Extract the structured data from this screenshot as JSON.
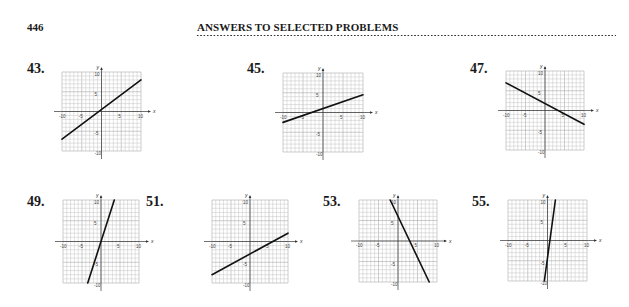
{
  "header": {
    "page_number": "446",
    "running_head": "ANSWERS TO SELECTED PROBLEMS"
  },
  "problems": [
    {
      "label": "43.",
      "pos": {
        "lx": 27,
        "ly": 61,
        "gx": 62,
        "gy": 72,
        "w": 79,
        "h": 79
      }
    },
    {
      "label": "45.",
      "pos": {
        "lx": 247,
        "ly": 61,
        "gx": 283,
        "gy": 73,
        "w": 80,
        "h": 79
      }
    },
    {
      "label": "47.",
      "pos": {
        "lx": 470,
        "ly": 61,
        "gx": 506,
        "gy": 71,
        "w": 78,
        "h": 79
      }
    },
    {
      "label": "49.",
      "pos": {
        "lx": 27,
        "ly": 194,
        "gx": 63,
        "gy": 200,
        "w": 76,
        "h": 83
      }
    },
    {
      "label": "51.",
      "pos": {
        "lx": 146,
        "ly": 194,
        "gx": 212,
        "gy": 200,
        "w": 76,
        "h": 83
      }
    },
    {
      "label": "53.",
      "pos": {
        "lx": 323,
        "ly": 194,
        "gx": 359,
        "gy": 200,
        "w": 78,
        "h": 82
      }
    },
    {
      "label": "55.",
      "pos": {
        "lx": 472,
        "ly": 194,
        "gx": 508,
        "gy": 200,
        "w": 79,
        "h": 81
      }
    }
  ],
  "chart_data": [
    {
      "type": "line",
      "title": "43.",
      "xlabel": "x",
      "ylabel": "y",
      "xlim": [
        -10,
        10
      ],
      "ylim": [
        -10,
        10
      ],
      "grid": true,
      "x_ticks": [
        "-10",
        "-5",
        "5",
        "10"
      ],
      "y_ticks": [
        "10",
        "5",
        "-5",
        "-10"
      ],
      "series": [
        {
          "name": "line",
          "x": [
            -10,
            10
          ],
          "y": [
            -7,
            8
          ]
        }
      ]
    },
    {
      "type": "line",
      "title": "45.",
      "xlabel": "x",
      "ylabel": "y",
      "xlim": [
        -10,
        10
      ],
      "ylim": [
        -10,
        10
      ],
      "grid": true,
      "x_ticks": [
        "-10",
        "-5",
        "5",
        "10"
      ],
      "y_ticks": [
        "10",
        "5",
        "-5",
        "-10"
      ],
      "series": [
        {
          "name": "line",
          "x": [
            -10,
            10
          ],
          "y": [
            -2.5,
            4.5
          ]
        }
      ]
    },
    {
      "type": "line",
      "title": "47.",
      "xlabel": "x",
      "ylabel": "y",
      "xlim": [
        -10,
        10
      ],
      "ylim": [
        -10,
        10
      ],
      "grid": true,
      "x_ticks": [
        "-10",
        "-5",
        "5",
        "10"
      ],
      "y_ticks": [
        "10",
        "5",
        "-5",
        "-10"
      ],
      "series": [
        {
          "name": "line",
          "x": [
            -10,
            10
          ],
          "y": [
            7,
            -3.5
          ]
        }
      ]
    },
    {
      "type": "line",
      "title": "49.",
      "xlabel": "x",
      "ylabel": "y",
      "xlim": [
        -10,
        10
      ],
      "ylim": [
        -10,
        10
      ],
      "grid": true,
      "x_ticks": [
        "-10",
        "-5",
        "5",
        "10"
      ],
      "y_ticks": [
        "10",
        "5",
        "-5",
        "-10"
      ],
      "series": [
        {
          "name": "line",
          "x": [
            -3.5,
            3.5
          ],
          "y": [
            -10,
            10
          ]
        }
      ]
    },
    {
      "type": "line",
      "title": "51.",
      "xlabel": "x",
      "ylabel": "y",
      "xlim": [
        -10,
        10
      ],
      "ylim": [
        -10,
        10
      ],
      "grid": true,
      "x_ticks": [
        "-10",
        "-5",
        "5",
        "10"
      ],
      "y_ticks": [
        "10",
        "5",
        "-5",
        "-10"
      ],
      "series": [
        {
          "name": "line",
          "x": [
            -10,
            10
          ],
          "y": [
            -8,
            2
          ]
        }
      ]
    },
    {
      "type": "line",
      "title": "53.",
      "xlabel": "x",
      "ylabel": "y",
      "xlim": [
        -10,
        10
      ],
      "ylim": [
        -10,
        10
      ],
      "grid": true,
      "x_ticks": [
        "-10",
        "-5",
        "5",
        "10"
      ],
      "y_ticks": [
        "10",
        "5",
        "-5",
        "-10"
      ],
      "series": [
        {
          "name": "line",
          "x": [
            -2,
            8
          ],
          "y": [
            10,
            -10
          ]
        }
      ]
    },
    {
      "type": "line",
      "title": "55.",
      "xlabel": "x",
      "ylabel": "y",
      "xlim": [
        -10,
        10
      ],
      "ylim": [
        -10,
        10
      ],
      "grid": true,
      "x_ticks": [
        "-10",
        "-5",
        "5",
        "10"
      ],
      "y_ticks": [
        "10",
        "5",
        "-5",
        "-10"
      ],
      "series": [
        {
          "name": "line",
          "x": [
            -0.8,
            2
          ],
          "y": [
            -10,
            10
          ]
        }
      ]
    }
  ]
}
